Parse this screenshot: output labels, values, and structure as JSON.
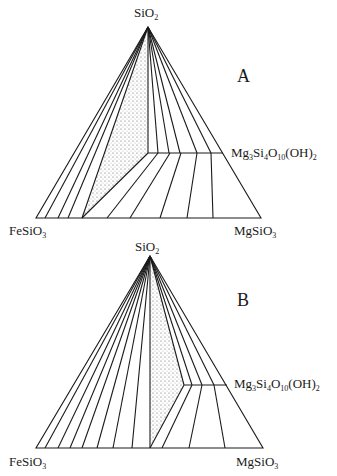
{
  "diagram_a": {
    "panel_label": "A",
    "apex_label": {
      "base": "SiO",
      "sub": "2"
    },
    "left_label": {
      "base": "FeSiO",
      "sub": "3"
    },
    "right_label": {
      "base": "MgSiO",
      "sub": "3"
    },
    "talc_label": {
      "parts": [
        "Mg",
        "3",
        "Si",
        "4",
        "O",
        "10",
        "(OH)",
        "2"
      ]
    }
  },
  "diagram_b": {
    "panel_label": "B",
    "apex_label": {
      "base": "SiO",
      "sub": "2"
    },
    "left_label": {
      "base": "FeSiO",
      "sub": "3"
    },
    "right_label": {
      "base": "MgSiO",
      "sub": "3"
    },
    "talc_label": {
      "parts": [
        "Mg",
        "3",
        "Si",
        "4",
        "O",
        "10",
        "(OH)",
        "2"
      ]
    }
  },
  "colors": {
    "line": "#1a1a1a",
    "stipple": "#555555",
    "background": "#ffffff"
  }
}
